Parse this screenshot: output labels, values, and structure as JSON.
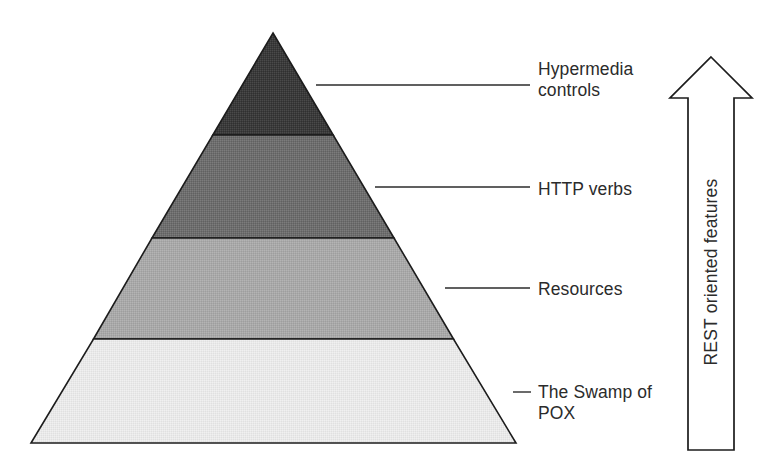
{
  "figure": {
    "type": "pyramid-diagram",
    "title_semantic": "richardson-maturity-model",
    "background_color": "#ffffff",
    "outline_color": "#1c1c1c",
    "text_color": "#2b2b2b"
  },
  "pyramid": {
    "apex": {
      "x": 273,
      "y": 33
    },
    "base_left": {
      "x": 31,
      "y": 443
    },
    "base_right": {
      "x": 516,
      "y": 443
    },
    "layers": [
      {
        "level": 3,
        "name": "hypermedia-controls",
        "label": "Hypermedia\ncontrols",
        "label_line1": "Hypermedia",
        "label_line2": "controls",
        "fill": "#3b3b3b",
        "top_y": 33,
        "bottom_y": 135
      },
      {
        "level": 2,
        "name": "http-verbs",
        "label": "HTTP verbs",
        "label_line1": "HTTP verbs",
        "label_line2": "",
        "fill": "#6e6e6e",
        "top_y": 135,
        "bottom_y": 238
      },
      {
        "level": 1,
        "name": "resources",
        "label": "Resources",
        "label_line1": "Resources",
        "label_line2": "",
        "fill": "#a9a9a9",
        "top_y": 238,
        "bottom_y": 339
      },
      {
        "level": 0,
        "name": "the-swamp-of-pox",
        "label": "The Swamp of\nPOX",
        "label_line1": "The Swamp of",
        "label_line2": "POX",
        "fill": "#e9e9e9",
        "top_y": 339,
        "bottom_y": 443
      }
    ]
  },
  "leader_lines": [
    {
      "name": "leader-hypermedia",
      "x1": 316,
      "x2": 530,
      "y": 85
    },
    {
      "name": "leader-http-verbs",
      "x1": 375,
      "x2": 530,
      "y": 187
    },
    {
      "name": "leader-resources",
      "x1": 445,
      "x2": 530,
      "y": 288
    },
    {
      "name": "leader-swamp-pox",
      "x1": 513,
      "x2": 531,
      "y": 392
    }
  ],
  "arrow": {
    "name": "rest-oriented-features-arrow",
    "caption": "REST oriented features",
    "direction": "up",
    "fill": "#ffffff",
    "stroke": "#1c1c1c",
    "tip": {
      "x": 711,
      "y": 57
    },
    "head_left": {
      "x": 670,
      "y": 98
    },
    "head_right": {
      "x": 752,
      "y": 98
    },
    "shaft_left_x": 688,
    "shaft_right_x": 734,
    "bottom_y": 450
  }
}
